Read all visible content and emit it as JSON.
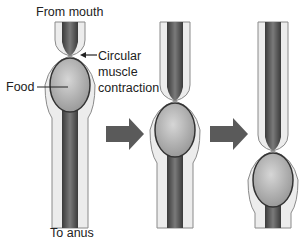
{
  "diagram": {
    "labels": {
      "top": "From mouth",
      "bottom": "To anus",
      "food": "Food",
      "contraction_line1": "Circular",
      "contraction_line2": "muscle",
      "contraction_line3": "contraction"
    },
    "stages": [
      {
        "name": "stage-1",
        "bolus_center_y": 85
      },
      {
        "name": "stage-2",
        "bolus_center_y": 130
      },
      {
        "name": "stage-3",
        "bolus_center_y": 180
      }
    ],
    "colors": {
      "lumen_dark": "#4a4a4a",
      "wall_light": "#e8e8e8",
      "outline": "#8a8a8a",
      "bolus": "#b0b0b0",
      "arrow": "#5a5a5a"
    }
  }
}
